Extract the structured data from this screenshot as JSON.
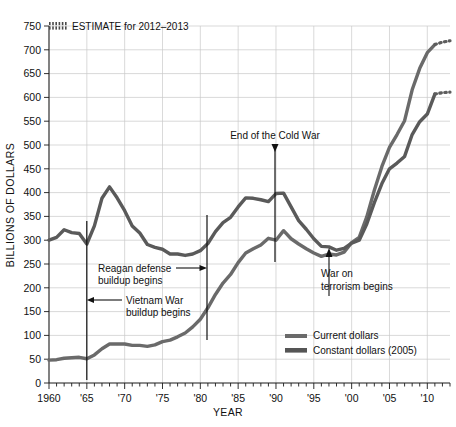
{
  "chart_data": {
    "type": "line",
    "title": "",
    "xlabel": "YEAR",
    "ylabel": "BILLIONS OF DOLLARS",
    "xlim": [
      1960,
      2013
    ],
    "ylim": [
      0,
      750
    ],
    "yticks": [
      0,
      50,
      100,
      150,
      200,
      250,
      300,
      350,
      400,
      450,
      500,
      550,
      600,
      650,
      700,
      750
    ],
    "ytick_labels": [
      "0",
      "50",
      "100",
      "150",
      "200",
      "250",
      "300",
      "350",
      "400",
      "450",
      "500",
      "550",
      "600",
      "650",
      "700",
      "750"
    ],
    "xticks": [
      1960,
      1965,
      1970,
      1975,
      1980,
      1985,
      1990,
      1995,
      2000,
      2005,
      2010
    ],
    "xtick_labels": [
      "1960",
      "'65",
      "'70",
      "'75",
      "'80",
      "'85",
      "'90",
      "'95",
      "'00",
      "'05",
      "'10"
    ],
    "grid": true,
    "legend_position": "bottom-right",
    "series": [
      {
        "name": "Current dollars",
        "color": "#6a6a6a",
        "x": [
          1960,
          1961,
          1962,
          1963,
          1964,
          1965,
          1966,
          1967,
          1968,
          1969,
          1970,
          1971,
          1972,
          1973,
          1974,
          1975,
          1976,
          1977,
          1978,
          1979,
          1980,
          1981,
          1982,
          1983,
          1984,
          1985,
          1986,
          1987,
          1988,
          1989,
          1990,
          1991,
          1992,
          1993,
          1994,
          1995,
          1996,
          1997,
          1998,
          1999,
          2000,
          2001,
          2002,
          2003,
          2004,
          2005,
          2006,
          2007,
          2008,
          2009,
          2010,
          2011
        ],
        "values": [
          48,
          49,
          52,
          53,
          54,
          51,
          59,
          72,
          82,
          82,
          82,
          79,
          79,
          77,
          80,
          87,
          90,
          97,
          105,
          118,
          134,
          158,
          186,
          210,
          228,
          253,
          273,
          282,
          290,
          304,
          300,
          320,
          303,
          292,
          282,
          273,
          266,
          271,
          269,
          275,
          295,
          306,
          349,
          405,
          455,
          495,
          522,
          551,
          616,
          661,
          694,
          711
        ]
      },
      {
        "name": "Constant dollars (2005)",
        "color": "#555555",
        "x": [
          1960,
          1961,
          1962,
          1963,
          1964,
          1965,
          1966,
          1967,
          1968,
          1969,
          1970,
          1971,
          1972,
          1973,
          1974,
          1975,
          1976,
          1977,
          1978,
          1979,
          1980,
          1981,
          1982,
          1983,
          1984,
          1985,
          1986,
          1987,
          1988,
          1989,
          1990,
          1991,
          1992,
          1993,
          1994,
          1995,
          1996,
          1997,
          1998,
          1999,
          2000,
          2001,
          2002,
          2003,
          2004,
          2005,
          2006,
          2007,
          2008,
          2009,
          2010,
          2011
        ],
        "values": [
          300,
          306,
          322,
          316,
          314,
          292,
          330,
          388,
          412,
          389,
          362,
          330,
          315,
          291,
          285,
          281,
          271,
          271,
          268,
          271,
          278,
          293,
          318,
          337,
          348,
          370,
          389,
          388,
          385,
          381,
          398,
          399,
          370,
          341,
          323,
          303,
          287,
          286,
          279,
          283,
          294,
          300,
          334,
          379,
          419,
          450,
          462,
          476,
          522,
          549,
          565,
          607
        ]
      }
    ],
    "estimate": {
      "label": "ESTIMATE for 2012–2013",
      "years": [
        2011,
        2012,
        2013
      ],
      "current_dollars": [
        711,
        716,
        719
      ],
      "constant_dollars": [
        607,
        610,
        611
      ]
    },
    "annotations": [
      {
        "name": "vietnam-war",
        "text_line1": "Vietnam War",
        "text_line2": "buildup begins",
        "year": 1965
      },
      {
        "name": "reagan-buildup",
        "text_line1": "Reagan defense",
        "text_line2": "buildup begins",
        "year": 1981
      },
      {
        "name": "end-cold-war",
        "text_line1": "End of the Cold War",
        "text_line2": "",
        "year": 1990
      },
      {
        "name": "war-on-terror",
        "text_line1": "War on",
        "text_line2": "terrorism begins",
        "year": 2001
      }
    ],
    "legend_entries": [
      {
        "label": "Current dollars",
        "color": "#6a6a6a"
      },
      {
        "label": "Constant dollars (2005)",
        "color": "#555555"
      }
    ]
  }
}
